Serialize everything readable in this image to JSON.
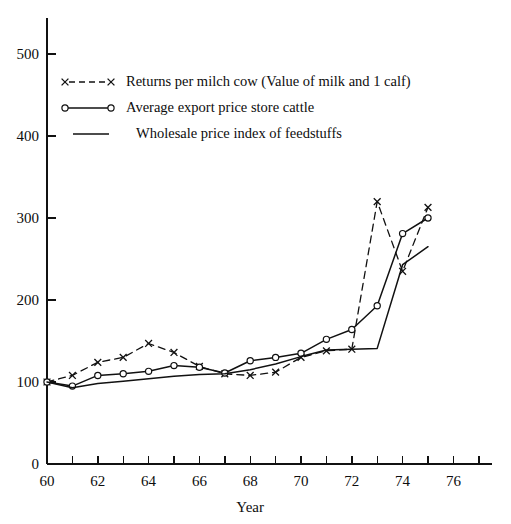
{
  "chart_data": {
    "type": "line",
    "title": "",
    "xlabel": "Year",
    "ylabel": "",
    "xlim": [
      60,
      77.5
    ],
    "ylim": [
      0,
      530
    ],
    "grid": false,
    "legend_position": "upper-left-inside",
    "x_ticks_major": [
      60,
      62,
      64,
      66,
      68,
      70,
      72,
      74,
      76
    ],
    "x_ticks_minor": [
      61,
      63,
      65,
      67,
      69,
      71,
      73,
      75,
      77
    ],
    "x_tick_labels": [
      "60",
      "62",
      "64",
      "66",
      "68",
      "70",
      "72",
      "74",
      "76"
    ],
    "y_ticks": [
      0,
      100,
      200,
      300,
      400,
      500
    ],
    "y_tick_labels": [
      "0",
      "100",
      "200",
      "300",
      "400",
      "500"
    ],
    "x": [
      60,
      61,
      62,
      63,
      64,
      65,
      66,
      67,
      68,
      69,
      70,
      71,
      72,
      73,
      74,
      75
    ],
    "series": [
      {
        "name": "Returns per milch cow (Value of milk and 1 calf)",
        "marker": "x",
        "style": "dashed",
        "values": [
          100,
          108,
          124,
          130,
          147,
          136,
          119,
          110,
          108,
          112,
          130,
          138,
          140,
          320,
          235,
          313
        ]
      },
      {
        "name": "Average export price store cattle",
        "marker": "o",
        "style": "solid",
        "values": [
          100,
          95,
          108,
          110,
          113,
          120,
          118,
          111,
          126,
          130,
          135,
          152,
          164,
          193,
          281,
          300
        ]
      },
      {
        "name": "Wholesale price index of feedstuffs",
        "marker": "none",
        "style": "solid",
        "values": [
          100,
          93,
          98,
          101,
          104,
          107,
          109,
          110,
          115,
          122,
          131,
          139,
          140,
          141,
          243,
          265
        ]
      }
    ],
    "peak_annotations": [
      {
        "series": "Returns per milch cow (Value of milk and 1 calf)",
        "year": 73,
        "value": 320
      },
      {
        "series": "Average export price store cattle",
        "year": 74,
        "value": 281
      },
      {
        "series": "Returns per milch cow (Value of milk and 1 calf)",
        "year": 75,
        "value": 313
      }
    ]
  },
  "legend": {
    "entries": [
      {
        "label": "Returns per milch cow (Value of milk and 1 calf)",
        "sample": "x-dashed-x"
      },
      {
        "label": "Average export price store cattle",
        "sample": "o-solid-o"
      },
      {
        "label": "Wholesale price index of feedstuffs",
        "sample": "solid"
      }
    ]
  },
  "axis": {
    "x_title": "Year"
  }
}
